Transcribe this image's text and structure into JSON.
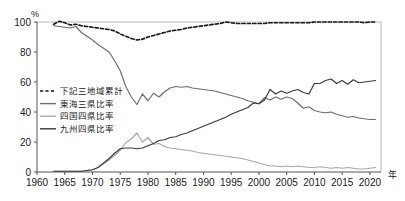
{
  "chart_data": {
    "type": "line",
    "title": "",
    "xlabel": "年",
    "ylabel": "%",
    "xlim": [
      1960,
      2022
    ],
    "ylim": [
      0,
      100
    ],
    "grid": false,
    "legend_position": "inside-left",
    "x_ticks": [
      1960,
      1965,
      1970,
      1975,
      1980,
      1985,
      1990,
      1995,
      2000,
      2005,
      2010,
      2015,
      2020
    ],
    "y_ticks": [
      0,
      20,
      40,
      60,
      80,
      100
    ],
    "x": [
      1963,
      1964,
      1965,
      1966,
      1967,
      1968,
      1969,
      1970,
      1971,
      1972,
      1973,
      1974,
      1975,
      1976,
      1977,
      1978,
      1979,
      1980,
      1981,
      1982,
      1983,
      1984,
      1985,
      1986,
      1987,
      1988,
      1989,
      1990,
      1991,
      1992,
      1993,
      1994,
      1995,
      1996,
      1997,
      1998,
      1999,
      2000,
      2001,
      2002,
      2003,
      2004,
      2005,
      2006,
      2007,
      2008,
      2009,
      2010,
      2011,
      2012,
      2013,
      2014,
      2015,
      2016,
      2017,
      2018,
      2019,
      2020,
      2021
    ],
    "series": [
      {
        "name": "下記三地域累計",
        "style": "dashed",
        "color": "#1a1a1a",
        "values": [
          98.5,
          100.5,
          99.5,
          98.0,
          98.5,
          97.5,
          97.0,
          96.5,
          96.0,
          95.5,
          95.0,
          94.0,
          92.0,
          90.5,
          89.0,
          88.0,
          88.5,
          90.0,
          91.0,
          92.0,
          93.0,
          94.0,
          94.5,
          95.0,
          96.0,
          96.5,
          97.0,
          97.5,
          98.0,
          98.5,
          99.0,
          100.0,
          99.5,
          99.0,
          99.0,
          99.0,
          99.0,
          99.0,
          99.0,
          99.5,
          99.5,
          99.5,
          99.5,
          99.5,
          99.5,
          99.5,
          99.5,
          100.0,
          100.0,
          100.0,
          100.0,
          100.0,
          100.0,
          100.0,
          100.0,
          100.0,
          99.5,
          100.0,
          100.0
        ]
      },
      {
        "name": "東海三県比率",
        "style": "solid",
        "color": "#6e6e6e",
        "values": [
          97.5,
          97.0,
          96.5,
          96.0,
          97.0,
          93.0,
          90.5,
          88.0,
          85.0,
          82.5,
          80.0,
          74.0,
          67.5,
          57.0,
          50.0,
          45.0,
          52.0,
          47.5,
          52.5,
          50.0,
          53.5,
          56.0,
          57.0,
          56.5,
          57.0,
          56.0,
          55.5,
          55.0,
          54.5,
          54.0,
          53.0,
          52.0,
          51.0,
          50.0,
          49.0,
          47.5,
          46.5,
          45.5,
          49.5,
          48.0,
          50.0,
          48.5,
          50.0,
          49.0,
          46.0,
          42.5,
          43.5,
          41.0,
          40.0,
          39.5,
          40.0,
          38.5,
          37.5,
          36.5,
          37.0,
          36.0,
          35.5,
          35.0,
          35.0
        ]
      },
      {
        "name": "四国四県比率",
        "style": "solid",
        "color": "#a8a8a8",
        "values": [
          0.5,
          0.5,
          0.5,
          0.5,
          0.5,
          0.5,
          1.0,
          1.5,
          3.0,
          5.5,
          8.0,
          11.0,
          14.5,
          19.5,
          22.0,
          26.0,
          20.0,
          23.0,
          18.5,
          19.0,
          17.0,
          16.0,
          15.5,
          15.0,
          14.5,
          14.0,
          13.0,
          12.5,
          12.0,
          11.5,
          11.0,
          10.5,
          10.0,
          9.5,
          9.0,
          8.0,
          7.0,
          6.0,
          5.0,
          4.0,
          4.0,
          3.5,
          4.0,
          3.5,
          4.0,
          3.5,
          3.0,
          3.0,
          3.5,
          3.0,
          2.5,
          3.0,
          2.5,
          3.0,
          2.5,
          2.0,
          2.0,
          2.5,
          3.0
        ]
      },
      {
        "name": "九州四県比率",
        "style": "solid",
        "color": "#3a3a3a",
        "values": [
          0.5,
          0.5,
          0.5,
          0.5,
          0.5,
          0.5,
          1.0,
          1.5,
          3.0,
          6.0,
          9.0,
          12.5,
          15.5,
          16.0,
          16.0,
          15.5,
          16.0,
          17.5,
          19.0,
          21.0,
          21.5,
          23.0,
          23.5,
          25.0,
          26.0,
          27.5,
          29.0,
          30.5,
          32.0,
          33.5,
          35.0,
          36.5,
          38.5,
          40.0,
          41.5,
          43.0,
          46.0,
          45.5,
          48.0,
          55.0,
          52.0,
          54.0,
          52.5,
          54.0,
          55.0,
          53.0,
          52.0,
          59.0,
          59.0,
          61.0,
          62.0,
          59.0,
          61.0,
          58.5,
          61.5,
          59.5,
          60.0,
          60.5,
          61.0
        ]
      }
    ]
  },
  "legend": {
    "items": [
      {
        "label": "下記三地域累計"
      },
      {
        "label": "東海三県比率"
      },
      {
        "label": "四国四県比率"
      },
      {
        "label": "九州四県比率"
      }
    ]
  },
  "axes": {
    "y_unit": "%",
    "x_unit": "年",
    "y_tick_labels": [
      "0",
      "20",
      "40",
      "60",
      "80",
      "100"
    ],
    "x_tick_labels": [
      "1960",
      "1965",
      "1970",
      "1975",
      "1980",
      "1985",
      "1990",
      "1995",
      "2000",
      "2005",
      "2010",
      "2015",
      "2020"
    ]
  }
}
